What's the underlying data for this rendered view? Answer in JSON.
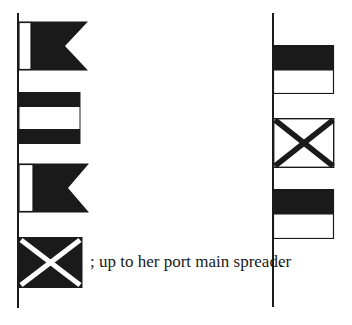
{
  "figure": {
    "left_hoist": {
      "flags": [
        {
          "name": "swallowtail flag, white hoist / black fly",
          "pattern": "burgee-white-black"
        },
        {
          "name": "horizontal black-white-black stripes",
          "pattern": "stripes-bwb"
        },
        {
          "name": "swallowtail flag, white hoist / black fly",
          "pattern": "burgee-white-black"
        },
        {
          "name": "black flag with white saltire",
          "pattern": "saltire-white-on-black"
        }
      ]
    },
    "right_hoist": {
      "flags": [
        {
          "name": "black over white",
          "pattern": "black-over-white"
        },
        {
          "name": "white flag with black saltire",
          "pattern": "saltire-black-on-white"
        },
        {
          "name": "black over white",
          "pattern": "black-over-white"
        }
      ]
    },
    "caption": {
      "text": "; up to her port main spreader",
      "end_mark": "."
    },
    "colors": {
      "ink": "#1a1a1a",
      "paper": "#ffffff"
    }
  }
}
